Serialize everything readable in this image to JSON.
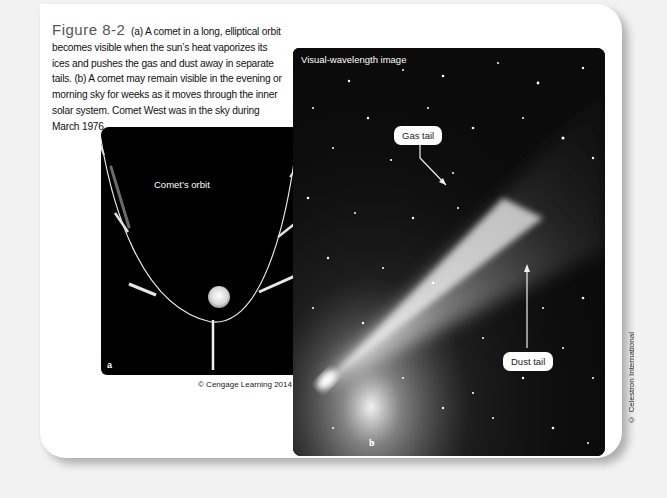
{
  "figure": {
    "label": "Figure 8-2",
    "caption": "(a) A comet in a long, elliptical orbit becomes visible when the sun’s heat vaporizes its ices and pushes the gas and dust away in separate tails. (b) A comet may remain visible in the evening or morning sky for weeks as it moves through the inner solar system. Comet West was in the sky during March 1976."
  },
  "panel_a": {
    "letter": "a",
    "orbit_label": "Comet’s orbit",
    "credit": "© Cengage Learning 2014"
  },
  "panel_b": {
    "letter": "b",
    "title": "Visual-wavelength image",
    "gas_tail_label": "Gas tail",
    "dust_tail_label": "Dust tail",
    "credit": "© Celestron International"
  }
}
